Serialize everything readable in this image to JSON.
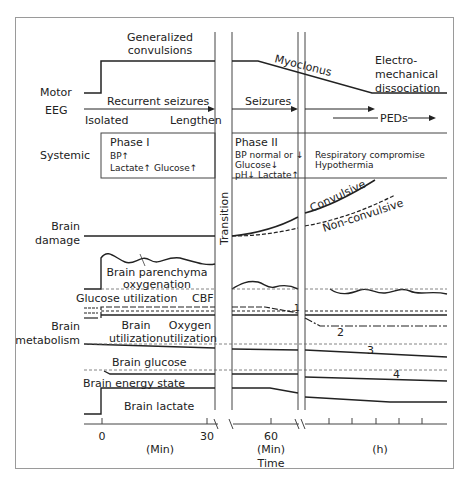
{
  "figure": {
    "rows": {
      "motor": "Motor",
      "eeg": "EEG",
      "systemic": "Systemic",
      "brain_damage": [
        "Brain",
        "damage"
      ],
      "brain_metabolism": [
        "Brain",
        "metabolism"
      ]
    },
    "motor": {
      "generalized": [
        "Generalized",
        "convulsions"
      ],
      "myoclonus": "Myoclonus",
      "emd": [
        "Electro-",
        "mechanical",
        "dissociation"
      ]
    },
    "eeg": {
      "recurrent": "Recurrent seizures",
      "isolated": "Isolated",
      "lengthen": "Lengthen",
      "seizures": "Seizures",
      "peds": "PEDs"
    },
    "phase1": {
      "title": "Phase I",
      "lines": [
        "BP↑",
        "Lactate↑ Glucose↑"
      ]
    },
    "phase2": {
      "title": "Phase II",
      "lines": [
        "BP normal or ↓",
        "Glucose↓",
        "pH↓ Lactate↑"
      ],
      "late": [
        "Respiratory compromise",
        "Hypothermia"
      ]
    },
    "transition": "Transition",
    "damage": {
      "convulsive": "Convulsive",
      "nonconvulsive": "Non-convulsive"
    },
    "metabolism": {
      "parenchyma": [
        "Brain parenchyma",
        "oxygenation"
      ],
      "glucose_util": "Glucose utilization",
      "cbf": "CBF",
      "brain_util": [
        "Brain",
        "utilization"
      ],
      "oxygen_util": [
        "Oxygen",
        "utilization"
      ],
      "brain_glucose": "Brain glucose",
      "energy_state": "Brain energy state",
      "lactate": "Brain lactate",
      "numbers": [
        "1",
        "2",
        "3",
        "4"
      ]
    },
    "axis": {
      "ticks": [
        "0",
        "30",
        "60"
      ],
      "units": [
        "(Min)",
        "(Min)",
        "(h)"
      ],
      "title": "Time"
    }
  }
}
